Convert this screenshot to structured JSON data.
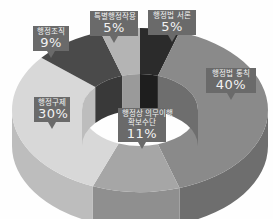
{
  "chart_data": {
    "type": "pie",
    "variant": "3d-donut",
    "title": "",
    "slices": [
      {
        "label": "행정법 서론",
        "value": 5,
        "pct_text": "5%",
        "color": "#2b2b2b",
        "side": "#1e1e1e"
      },
      {
        "label": "행정법 통칙",
        "value": 40,
        "pct_text": "40%",
        "color": "#8a8a8a",
        "side": "#6e6e6e"
      },
      {
        "label": "행정상 의무이행 확보수단",
        "label_lines": [
          "행정상 의무이행",
          "확보수단"
        ],
        "value": 11,
        "pct_text": "11%",
        "color": "#a6a6a6",
        "side": "#8f8f8f"
      },
      {
        "label": "행정구제",
        "value": 30,
        "pct_text": "30%",
        "color": "#d8d8d8",
        "side": "#bdbdbd"
      },
      {
        "label": "행정조직",
        "value": 9,
        "pct_text": "9%",
        "color": "#4a4a4a",
        "side": "#393939"
      },
      {
        "label": "특별행정작용",
        "value": 5,
        "pct_text": "5%",
        "color": "#b4b4b4",
        "side": "#9a9a9a"
      }
    ],
    "legend": "none"
  }
}
